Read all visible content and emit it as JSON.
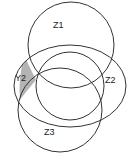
{
  "diagram": {
    "type": "venn",
    "sets": [
      {
        "id": "z1",
        "label": "Z1"
      },
      {
        "id": "z2",
        "label": "Z2"
      },
      {
        "id": "z3",
        "label": "Z3"
      },
      {
        "id": "y2",
        "label": "Y2"
      }
    ],
    "highlighted_region": {
      "label": "Y2",
      "color": "#b4b4b4"
    },
    "stroke_color": "#333333"
  }
}
